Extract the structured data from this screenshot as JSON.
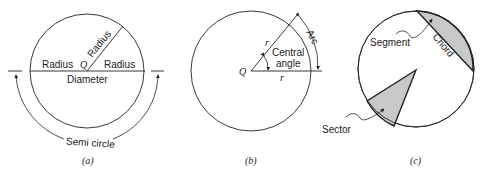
{
  "figure_a": {
    "labels": {
      "radius_left": "Radius",
      "radius_right": "Radius",
      "radius_diagonal": "Radius",
      "center": "Q",
      "diameter": "Diameter",
      "semicircle": "Semi circle"
    },
    "caption": "(a)"
  },
  "figure_b": {
    "labels": {
      "center": "Q",
      "r_upper": "r",
      "r_lower": "r",
      "central_angle_line1": "Central",
      "central_angle_line2": "angle",
      "arc": "Arc"
    },
    "caption": "(b)"
  },
  "figure_c": {
    "labels": {
      "segment": "Segment",
      "chord": "Chord",
      "sector": "Sector"
    },
    "caption": "(c)",
    "fill_color": "#c8c8c8"
  },
  "colors": {
    "stroke": "#222222",
    "shade": "#c8c8c8"
  }
}
